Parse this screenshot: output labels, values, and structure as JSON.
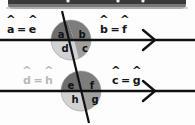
{
  "topbar": {
    "present": true,
    "style": "dark rounded toolbar strip, partially cropped",
    "color": "#3a3a3a",
    "dots": 3
  },
  "figure": {
    "background": "#fdfdfd",
    "line_color": "#111111",
    "lines": [
      {
        "name": "upper-parallel-line",
        "y": 40,
        "x1": 0,
        "x2": 195,
        "arrow_x": 150
      },
      {
        "name": "lower-parallel-line",
        "y": 91,
        "x1": 0,
        "x2": 195,
        "arrow_x": 150
      }
    ],
    "transversal": {
      "name": "transversal-line",
      "x1": 62,
      "y1": 11,
      "x2": 89,
      "y2": 123
    }
  },
  "circles": [
    {
      "name": "upper-intersection",
      "cx": 71,
      "cy": 40,
      "r": 20,
      "quadrants": [
        {
          "id": "a",
          "position": "top-left",
          "label": "a",
          "fill": "#6e6e6e"
        },
        {
          "id": "b",
          "position": "top-right",
          "label": "b",
          "fill": "#7d7d7d"
        },
        {
          "id": "d",
          "position": "bottom-left",
          "label": "d",
          "fill": "#d2d2d2"
        },
        {
          "id": "c",
          "position": "bottom-right",
          "label": "c",
          "fill": "#a0a0a0"
        }
      ]
    },
    {
      "name": "lower-intersection",
      "cx": 81,
      "cy": 91,
      "r": 20,
      "quadrants": [
        {
          "id": "e",
          "position": "top-left",
          "label": "e",
          "fill": "#6e6e6e"
        },
        {
          "id": "f",
          "position": "top-right",
          "label": "f",
          "fill": "#7d7d7d"
        },
        {
          "id": "h",
          "position": "bottom-left",
          "label": "h",
          "fill": "#d2d2d2"
        },
        {
          "id": "g",
          "position": "bottom-right",
          "label": "g",
          "fill": "#a0a0a0"
        }
      ]
    }
  ],
  "equations": [
    {
      "name": "eq-a-e",
      "left": "a",
      "right": "e",
      "operator": "=",
      "color": "#151515"
    },
    {
      "name": "eq-b-f",
      "left": "b",
      "right": "f",
      "operator": "=",
      "color": "#151515"
    },
    {
      "name": "eq-d-h",
      "left": "d",
      "right": "h",
      "operator": "=",
      "color": "#b9b9b9"
    },
    {
      "name": "eq-c-g",
      "left": "c",
      "right": "g",
      "operator": "=",
      "color": "#151515"
    }
  ],
  "colors": {
    "ink": "#111111",
    "quadrant_dark": "#6e6e6e",
    "quadrant_mid_dark": "#7d7d7d",
    "quadrant_mid": "#a0a0a0",
    "quadrant_light": "#d2d2d2",
    "faded_text": "#b9b9b9",
    "toolbar": "#3a3a3a"
  }
}
